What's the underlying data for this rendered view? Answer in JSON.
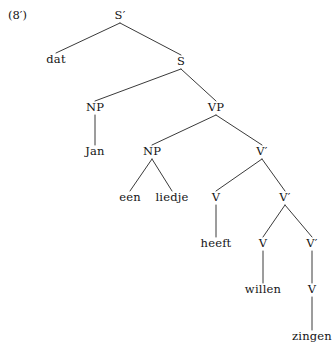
{
  "figure": {
    "example_number": "(8′)",
    "type": "syntax-tree",
    "language": "Dutch",
    "sentence": "dat Jan een liedje heeft willen zingen",
    "line_color": "#3a3a3a",
    "text_color": "#141414",
    "background": "#ffffff",
    "width": 336,
    "height": 351
  },
  "nodes": [
    {
      "id": "n0",
      "label": "S′",
      "kind": "category",
      "x": 120,
      "y": 16
    },
    {
      "id": "n1",
      "label": "dat",
      "kind": "leaf",
      "x": 56,
      "y": 60
    },
    {
      "id": "n2",
      "label": "S",
      "kind": "category",
      "x": 181,
      "y": 62
    },
    {
      "id": "n3",
      "label": "NP",
      "kind": "category",
      "x": 95,
      "y": 108
    },
    {
      "id": "n4",
      "label": "Jan",
      "kind": "leaf",
      "x": 95,
      "y": 152
    },
    {
      "id": "n5",
      "label": "VP",
      "kind": "category",
      "x": 216,
      "y": 108
    },
    {
      "id": "n6",
      "label": "NP",
      "kind": "category",
      "x": 152,
      "y": 152
    },
    {
      "id": "n7",
      "label": "een",
      "kind": "leaf",
      "x": 130,
      "y": 198
    },
    {
      "id": "n8",
      "label": "liedje",
      "kind": "leaf",
      "x": 172,
      "y": 198
    },
    {
      "id": "n9",
      "label": "V′",
      "kind": "category",
      "x": 262,
      "y": 152
    },
    {
      "id": "n10",
      "label": "V",
      "kind": "category",
      "x": 216,
      "y": 198
    },
    {
      "id": "n11",
      "label": "heeft",
      "kind": "leaf",
      "x": 216,
      "y": 244
    },
    {
      "id": "n12",
      "label": "V′",
      "kind": "category",
      "x": 285,
      "y": 198
    },
    {
      "id": "n13",
      "label": "V",
      "kind": "category",
      "x": 263,
      "y": 244
    },
    {
      "id": "n14",
      "label": "willen",
      "kind": "leaf",
      "x": 263,
      "y": 290
    },
    {
      "id": "n15",
      "label": "V′",
      "kind": "category",
      "x": 312,
      "y": 244
    },
    {
      "id": "n16",
      "label": "V",
      "kind": "category",
      "x": 312,
      "y": 290
    },
    {
      "id": "n17",
      "label": "zingen",
      "kind": "leaf",
      "x": 312,
      "y": 337
    }
  ],
  "edges": [
    {
      "from": "n0",
      "to": "n1"
    },
    {
      "from": "n0",
      "to": "n2"
    },
    {
      "from": "n2",
      "to": "n3"
    },
    {
      "from": "n2",
      "to": "n5"
    },
    {
      "from": "n3",
      "to": "n4"
    },
    {
      "from": "n5",
      "to": "n6"
    },
    {
      "from": "n5",
      "to": "n9"
    },
    {
      "from": "n6",
      "to": "n7"
    },
    {
      "from": "n6",
      "to": "n8"
    },
    {
      "from": "n9",
      "to": "n10"
    },
    {
      "from": "n9",
      "to": "n12"
    },
    {
      "from": "n10",
      "to": "n11"
    },
    {
      "from": "n12",
      "to": "n13"
    },
    {
      "from": "n12",
      "to": "n15"
    },
    {
      "from": "n13",
      "to": "n14"
    },
    {
      "from": "n15",
      "to": "n16"
    },
    {
      "from": "n16",
      "to": "n17"
    }
  ]
}
